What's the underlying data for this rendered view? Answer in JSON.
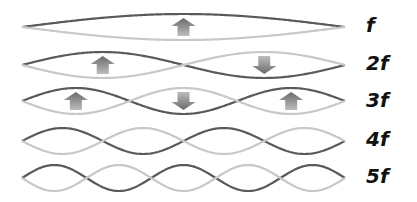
{
  "diagram": {
    "colors": {
      "dark_wave": "#5a5a5a",
      "light_wave": "#c8c8c8",
      "arrow_top": "#6a6a6a",
      "arrow_bottom": "#bdbdbd"
    },
    "wave_x_start": 22,
    "wave_x_end": 345,
    "amplitude": 13,
    "rows": [
      {
        "label": "f",
        "harmonic": 1,
        "center_y": 27,
        "arrows": [
          "up"
        ]
      },
      {
        "label": "2f",
        "harmonic": 2,
        "center_y": 65,
        "arrows": [
          "up",
          "down"
        ]
      },
      {
        "label": "3f",
        "harmonic": 3,
        "center_y": 101,
        "arrows": [
          "up",
          "down",
          "up"
        ]
      },
      {
        "label": "4f",
        "harmonic": 4,
        "center_y": 141,
        "arrows": []
      },
      {
        "label": "5f",
        "harmonic": 5,
        "center_y": 178,
        "arrows": []
      }
    ]
  }
}
